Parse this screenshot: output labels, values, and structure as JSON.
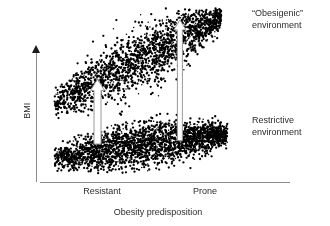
{
  "figure": {
    "axes": {
      "y_title": "BMI",
      "x_title": "Obesity predisposition",
      "x_ticks": [
        "Resistant",
        "Prone"
      ]
    },
    "annotations": {
      "top_label": "“Obesigenic”\nenvironment",
      "bottom_label": "Restrictive\nenvironment"
    },
    "colors": {
      "points": "#000000",
      "axis": "#8c8c8c",
      "text": "#2b2b2b",
      "arrow_fill": "#ffffff",
      "arrow_stroke": "#9a9a9a",
      "background": "#ffffff"
    }
  },
  "chart_data": {
    "type": "scatter",
    "title": "",
    "xlabel": "Obesity predisposition",
    "ylabel": "BMI",
    "xlim": [
      0,
      1
    ],
    "ylim": [
      0,
      1
    ],
    "grid": false,
    "legend": "none",
    "xtick_positions": [
      0.25,
      0.65
    ],
    "xtick_labels": [
      "Resistant",
      "Prone"
    ],
    "series": [
      {
        "name": "Obesigenic environment",
        "n_points": 2000,
        "x_range": [
          0.04,
          0.85
        ],
        "y_intercept": 0.42,
        "y_slope": 0.62,
        "y_spread": 0.075,
        "description": "Upper band: BMI rises steeply with predisposition under an obesigenic environment"
      },
      {
        "name": "Restrictive environment",
        "n_points": 2400,
        "x_range": [
          0.04,
          0.88
        ],
        "y_intercept": 0.11,
        "y_slope": 0.17,
        "y_spread": 0.055,
        "description": "Lower band: BMI rises only slightly with predisposition under a restrictive environment"
      }
    ],
    "annotations": [
      {
        "name": "effect-arrow-resistant",
        "label": "Resistant",
        "x": 0.25,
        "y_from": 0.2,
        "y_to": 0.58,
        "magnitude": 0.38,
        "direction": "up"
      },
      {
        "name": "effect-arrow-prone",
        "label": "Prone",
        "x": 0.65,
        "y_from": 0.22,
        "y_to": 0.93,
        "magnitude": 0.71,
        "direction": "up"
      }
    ]
  }
}
